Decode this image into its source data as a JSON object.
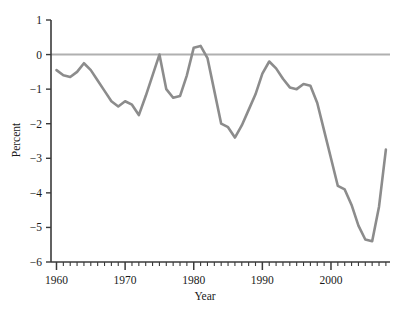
{
  "chart_data": {
    "type": "line",
    "title": "",
    "xlabel": "Year",
    "ylabel": "Percent",
    "xlim": [
      1959.2,
      2008.6
    ],
    "ylim": [
      -6,
      1
    ],
    "grid": false,
    "legend": null,
    "yticks": [
      1,
      0,
      -1,
      -2,
      -3,
      -4,
      -5,
      -6
    ],
    "ytick_labels": [
      "1",
      "0",
      "−1",
      "−2",
      "−3",
      "−4",
      "−5",
      "−6"
    ],
    "xticks": [
      1960,
      1970,
      1980,
      1990,
      2000
    ],
    "xtick_labels": [
      "1960",
      "1970",
      "1980",
      "1990",
      "2000"
    ],
    "minor_xtick_interval": 1,
    "reference_line": {
      "value": 0,
      "color": "#b0b0b0",
      "width": 2
    },
    "series": [
      {
        "name": "Percent",
        "color": "#8c8c8c",
        "width": 2.6,
        "x": [
          1960,
          1961,
          1962,
          1963,
          1964,
          1965,
          1966,
          1967,
          1968,
          1969,
          1970,
          1971,
          1972,
          1973,
          1974,
          1975,
          1976,
          1977,
          1978,
          1979,
          1980,
          1981,
          1982,
          1983,
          1984,
          1985,
          1986,
          1987,
          1988,
          1989,
          1990,
          1991,
          1992,
          1993,
          1994,
          1995,
          1996,
          1997,
          1998,
          1999,
          2000,
          2001,
          2002,
          2003,
          2004,
          2005,
          2006,
          2007,
          2008
        ],
        "values": [
          -0.45,
          -0.6,
          -0.65,
          -0.5,
          -0.25,
          -0.45,
          -0.75,
          -1.05,
          -1.35,
          -1.5,
          -1.35,
          -1.45,
          -1.75,
          -1.2,
          -0.6,
          0.0,
          -1.0,
          -1.25,
          -1.2,
          -0.6,
          0.2,
          0.25,
          -0.1,
          -1.05,
          -2.0,
          -2.1,
          -2.4,
          -2.05,
          -1.6,
          -1.15,
          -0.55,
          -0.2,
          -0.4,
          -0.7,
          -0.95,
          -1.0,
          -0.85,
          -0.9,
          -1.4,
          -2.2,
          -3.0,
          -3.8,
          -3.9,
          -4.35,
          -4.95,
          -5.35,
          -5.4,
          -4.4,
          -2.75
        ]
      }
    ]
  },
  "axes": {
    "ylabel_text": "Percent",
    "xlabel_text": "Year"
  }
}
